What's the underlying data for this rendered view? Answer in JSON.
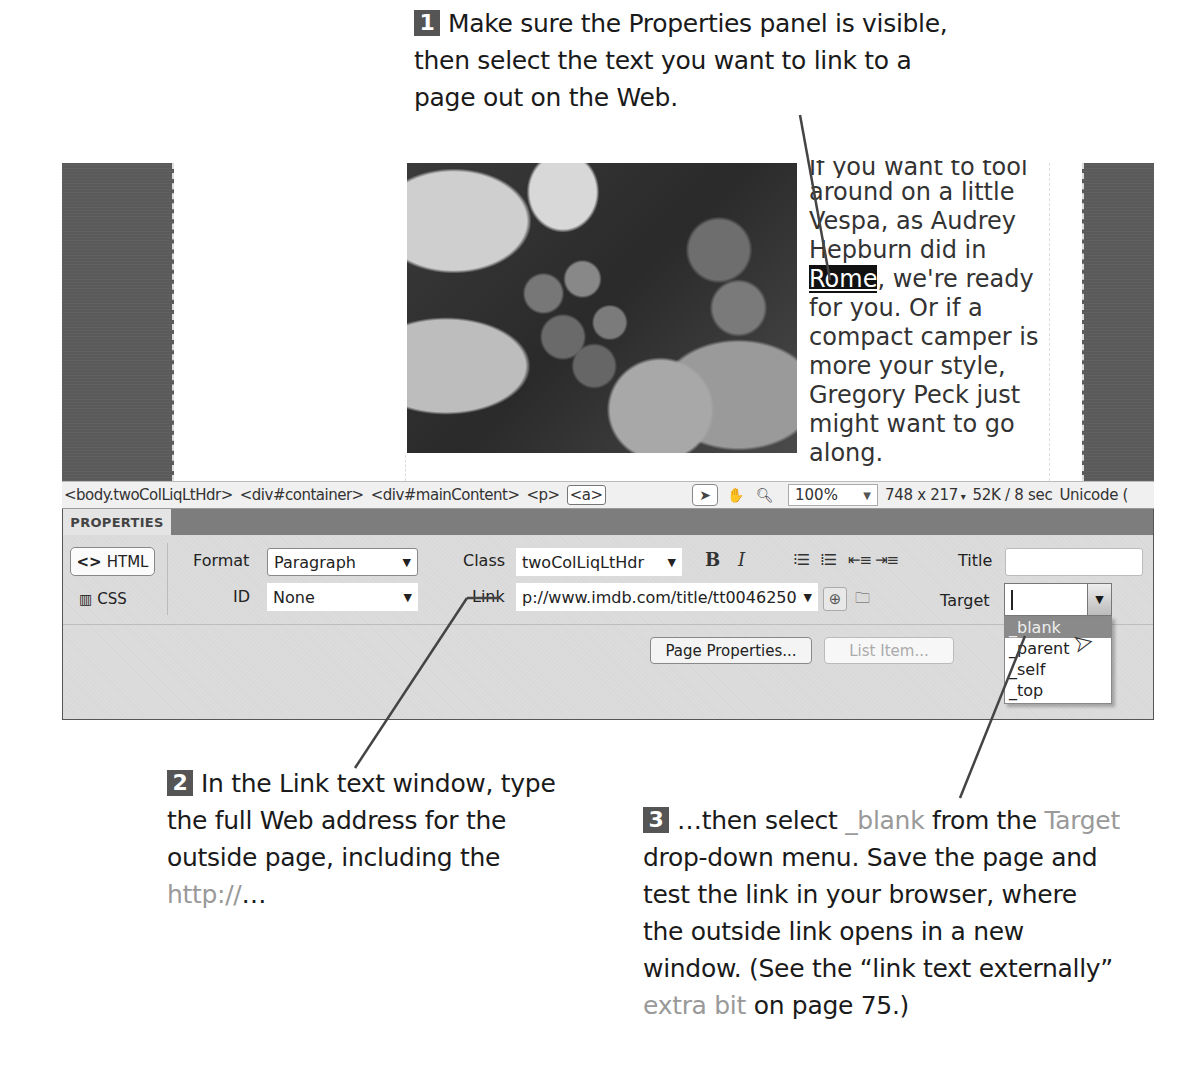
{
  "callouts": {
    "step1": {
      "number": "1",
      "text": "Make sure the Properties panel is visible, then select the text you want to link to a page out on the Web."
    },
    "step2": {
      "number": "2",
      "text_before": "In the Link text window, type the full Web address for the outside page, including the ",
      "highlight": "http://",
      "text_after": "…"
    },
    "step3": {
      "number": "3",
      "text_a": "…then select ",
      "highlight_a": "_blank",
      "text_b": " from the ",
      "highlight_b": "Target",
      "text_c": " drop-down menu. Save the page and test the link in your browser, where the outside link opens in a new window. (See the “link text externally” ",
      "highlight_c": "extra bit",
      "text_d": " on page 75.)"
    }
  },
  "design_view": {
    "paragraph": {
      "line_clipped": "If you want to tool",
      "before": "around on a little Vespa, as Audrey Hepburn did in ",
      "selected": "Rome",
      "after": ", we're ready for you. Or if a compact camper is more your style, Gregory Peck just might want to go along."
    },
    "image_alt": "grapes-on-vine-photo"
  },
  "status_bar": {
    "tags": [
      "<body.twoColLiqLtHdr>",
      "<div#container>",
      "<div#mainContent>",
      "<p>",
      "<a>"
    ],
    "selected_tag_index": 4,
    "tools": {
      "select": "select-tool",
      "hand": "hand-tool",
      "zoom": "zoom-tool"
    },
    "zoom_level": "100%",
    "window_size": "748 x 217",
    "download": "52K / 8 sec",
    "encoding": "Unicode ("
  },
  "properties": {
    "tab_label": "PROPERTIES",
    "html_button": "HTML",
    "css_button": "CSS",
    "format_label": "Format",
    "format_value": "Paragraph",
    "id_label": "ID",
    "id_value": "None",
    "class_label": "Class",
    "class_value": "twoColLiqLtHdr",
    "link_label": "Link",
    "link_value": "p://www.imdb.com/title/tt0046250",
    "bold_label": "B",
    "italic_label": "I",
    "title_label": "Title",
    "title_value": "",
    "target_label": "Target",
    "target_value": "",
    "target_options": [
      "_blank",
      "_parent",
      "_self",
      "_top"
    ],
    "target_hover_index": 0,
    "page_properties_button": "Page Properties...",
    "list_item_button": "List Item..."
  }
}
